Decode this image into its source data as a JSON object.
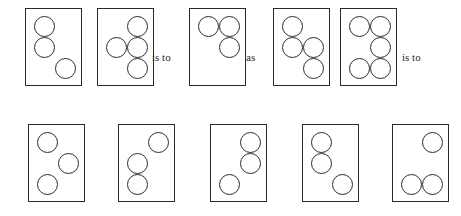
{
  "puzzle": {
    "kind": "visual-analogy-matrix",
    "instruction_text": "",
    "geometry": {
      "canvas_width": 461,
      "canvas_height": 216,
      "panel_width": 57,
      "panel_height": 78,
      "dot_diameter": 21,
      "stroke_color": "#2a2a2a",
      "background_color": "#ffffff",
      "stroke_width_px": 1.6
    },
    "cell_grid": {
      "columns": [
        "left",
        "right"
      ],
      "rows": [
        "top",
        "middle",
        "bottom"
      ]
    },
    "relations": [
      {
        "id": "rel-1",
        "label": "is to",
        "x": 152,
        "y": 52
      },
      {
        "id": "rel-2",
        "label": "as",
        "x": 246,
        "y": 52
      },
      {
        "id": "rel-3",
        "label": "is to",
        "x": 402,
        "y": 52
      }
    ],
    "prompt_row": {
      "row_label": "prompt",
      "y": 8,
      "panels": [
        {
          "id": "prompt-panel-1",
          "name": "prompt-panel-1",
          "position": 1,
          "x": 25,
          "dot_count": 3,
          "dots": [
            {
              "cell": "top-left",
              "x": 8,
              "y": 7
            },
            {
              "cell": "middle-left",
              "x": 8,
              "y": 28
            },
            {
              "cell": "bottom-right",
              "x": 29,
              "y": 49
            }
          ]
        },
        {
          "id": "prompt-panel-2",
          "name": "prompt-panel-2",
          "position": 2,
          "x": 97,
          "dot_count": 4,
          "dots": [
            {
              "cell": "top-right",
              "x": 29,
              "y": 7
            },
            {
              "cell": "middle-left",
              "x": 8,
              "y": 28
            },
            {
              "cell": "middle-right",
              "x": 29,
              "y": 28
            },
            {
              "cell": "bottom-right",
              "x": 29,
              "y": 49
            }
          ]
        },
        {
          "id": "prompt-panel-3",
          "name": "prompt-panel-3",
          "position": 3,
          "x": 189,
          "dot_count": 3,
          "dots": [
            {
              "cell": "top-left",
              "x": 8,
              "y": 7
            },
            {
              "cell": "top-right",
              "x": 29,
              "y": 7
            },
            {
              "cell": "middle-right",
              "x": 29,
              "y": 28
            }
          ]
        },
        {
          "id": "prompt-panel-4",
          "name": "prompt-panel-4",
          "position": 4,
          "x": 273,
          "dot_count": 4,
          "dots": [
            {
              "cell": "top-left",
              "x": 8,
              "y": 7
            },
            {
              "cell": "middle-left",
              "x": 8,
              "y": 28
            },
            {
              "cell": "middle-right",
              "x": 29,
              "y": 28
            },
            {
              "cell": "bottom-right",
              "x": 29,
              "y": 49
            }
          ]
        },
        {
          "id": "prompt-panel-5",
          "name": "prompt-panel-5",
          "position": 5,
          "x": 340,
          "dot_count": 5,
          "dots": [
            {
              "cell": "top-left",
              "x": 8,
              "y": 7
            },
            {
              "cell": "top-right",
              "x": 29,
              "y": 7
            },
            {
              "cell": "middle-right",
              "x": 29,
              "y": 28
            },
            {
              "cell": "bottom-left",
              "x": 8,
              "y": 49
            },
            {
              "cell": "bottom-right",
              "x": 29,
              "y": 49
            }
          ]
        }
      ]
    },
    "option_row": {
      "row_label": "options",
      "y": 124,
      "panels": [
        {
          "id": "option-panel-a",
          "name": "option-panel-a",
          "position": 1,
          "x": 28,
          "dot_count": 3,
          "dots": [
            {
              "cell": "top-left",
              "x": 8,
              "y": 7
            },
            {
              "cell": "middle-right",
              "x": 29,
              "y": 28
            },
            {
              "cell": "bottom-left",
              "x": 8,
              "y": 49
            }
          ]
        },
        {
          "id": "option-panel-b",
          "name": "option-panel-b",
          "position": 2,
          "x": 118,
          "dot_count": 3,
          "dots": [
            {
              "cell": "top-right",
              "x": 29,
              "y": 7
            },
            {
              "cell": "middle-left",
              "x": 8,
              "y": 28
            },
            {
              "cell": "bottom-left",
              "x": 8,
              "y": 49
            }
          ]
        },
        {
          "id": "option-panel-c",
          "name": "option-panel-c",
          "position": 3,
          "x": 210,
          "dot_count": 3,
          "dots": [
            {
              "cell": "top-right",
              "x": 29,
              "y": 7
            },
            {
              "cell": "middle-right",
              "x": 29,
              "y": 28
            },
            {
              "cell": "bottom-left",
              "x": 8,
              "y": 49
            }
          ]
        },
        {
          "id": "option-panel-d",
          "name": "option-panel-d",
          "position": 4,
          "x": 302,
          "dot_count": 3,
          "dots": [
            {
              "cell": "top-left",
              "x": 8,
              "y": 7
            },
            {
              "cell": "middle-left",
              "x": 8,
              "y": 28
            },
            {
              "cell": "bottom-right",
              "x": 29,
              "y": 49
            }
          ]
        },
        {
          "id": "option-panel-e",
          "name": "option-panel-e",
          "position": 5,
          "x": 392,
          "dot_count": 3,
          "dots": [
            {
              "cell": "top-right",
              "x": 29,
              "y": 7
            },
            {
              "cell": "bottom-left",
              "x": 8,
              "y": 49
            },
            {
              "cell": "bottom-right",
              "x": 29,
              "y": 49
            }
          ]
        }
      ]
    }
  }
}
